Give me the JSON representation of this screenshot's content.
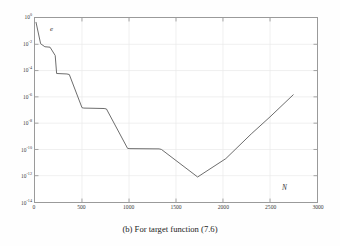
{
  "caption": "(b) For target function (7.6)",
  "axes": {
    "x_axis_name": "N",
    "y_axis_name": "e"
  },
  "ticks": {
    "y": [
      {
        "mantissa": "10",
        "exponent": "0"
      },
      {
        "mantissa": "10",
        "exponent": "-2"
      },
      {
        "mantissa": "10",
        "exponent": "-4"
      },
      {
        "mantissa": "10",
        "exponent": "-6"
      },
      {
        "mantissa": "10",
        "exponent": "-8"
      },
      {
        "mantissa": "10",
        "exponent": "-10"
      },
      {
        "mantissa": "10",
        "exponent": "-12"
      },
      {
        "mantissa": "10",
        "exponent": "-14"
      }
    ],
    "x": [
      "0",
      "500",
      "1000",
      "1500",
      "2000",
      "2500",
      "3000"
    ]
  },
  "colors": {
    "curve": "#6b6b6b",
    "axis": "#9a9a9a",
    "grid": "#e8e8e8",
    "text": "#333333",
    "background": "#ffffff"
  },
  "chart_data": {
    "type": "line",
    "title": "",
    "xlabel": "N",
    "ylabel": "e",
    "xlim": [
      0,
      3000
    ],
    "ylim": [
      1e-14,
      1
    ],
    "yscale": "log",
    "xscale": "linear",
    "grid": true,
    "legend": null,
    "xticks": [
      0,
      500,
      1000,
      1500,
      2000,
      2500,
      3000
    ],
    "yticks": [
      1,
      0.01,
      0.0001,
      1e-06,
      1e-08,
      1e-10,
      1e-12,
      1e-14
    ],
    "series": [
      {
        "name": "error",
        "x": [
          10,
          60,
          105,
          160,
          215,
          230,
          340,
          365,
          500,
          520,
          735,
          760,
          985,
          1010,
          1320,
          1345,
          1730,
          2030,
          2300,
          2500,
          2750
        ],
        "y": [
          0.5,
          0.011,
          0.0065,
          0.006,
          0.0014,
          6e-05,
          5.5e-05,
          5e-05,
          1.5e-07,
          1.4e-07,
          1.3e-07,
          1.2e-07,
          1.2e-10,
          1.15e-10,
          1.1e-10,
          1e-10,
          8e-13,
          2e-11,
          1.5e-09,
          3e-08,
          1.5e-06
        ]
      }
    ],
    "annotations": [
      {
        "text": "e",
        "x": 180,
        "y": 0.12,
        "style": "italic"
      },
      {
        "text": "N",
        "x": 2640,
        "y": 2e-13,
        "style": "italic"
      }
    ]
  }
}
